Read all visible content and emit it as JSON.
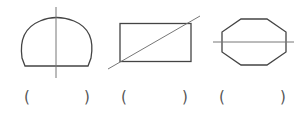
{
  "figures": [
    {
      "name": "dome-with-vertical-line",
      "shape": "semicircular dome",
      "line": "vertical"
    },
    {
      "name": "rectangle-with-diagonal-line",
      "shape": "rectangle",
      "line": "diagonal"
    },
    {
      "name": "octagon-with-horizontal-line",
      "shape": "octagon",
      "line": "horizontal"
    }
  ],
  "answers": [
    {
      "open": "(",
      "close": ")",
      "value": ""
    },
    {
      "open": "(",
      "close": ")",
      "value": ""
    },
    {
      "open": "(",
      "close": ")",
      "value": ""
    }
  ],
  "colors": {
    "stroke": "#444444",
    "line": "#777777"
  }
}
